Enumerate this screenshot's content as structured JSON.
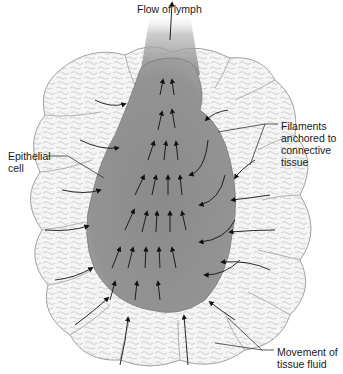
{
  "figure": {
    "colors": {
      "capillary_fill": "#8f8f8f",
      "capillary_edge": "#7a7a7a",
      "lymph_plume": "#9a9a9a",
      "cell_outline": "#9a9a9a",
      "cell_fill": "#f4f4f4",
      "arrow": "#111111",
      "leader_line": "#333333"
    },
    "labels": {
      "flow_of_lymph": "Flow of lymph",
      "epithelial_cell": "Epithelial\ncell",
      "filaments": "Filaments\nanchored to\nconnective\ntissue",
      "movement": "Movement of\ntissue fluid"
    }
  }
}
